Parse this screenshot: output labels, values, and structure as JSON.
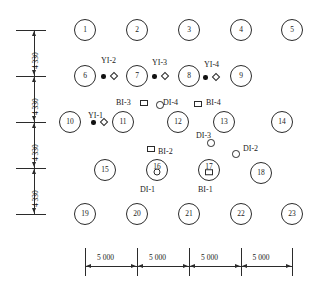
{
  "diagram": {
    "pile_diameter_px": 22,
    "piles": [
      {
        "id": "1",
        "label": "1",
        "x": 85,
        "y": 30,
        "glyph": "none"
      },
      {
        "id": "2",
        "label": "2",
        "x": 137,
        "y": 30,
        "glyph": "none"
      },
      {
        "id": "3",
        "label": "3",
        "x": 189,
        "y": 30,
        "glyph": "none"
      },
      {
        "id": "4",
        "label": "4",
        "x": 241,
        "y": 30,
        "glyph": "none"
      },
      {
        "id": "5",
        "label": "5",
        "x": 292,
        "y": 30,
        "glyph": "none"
      },
      {
        "id": "6",
        "label": "6",
        "x": 85,
        "y": 76,
        "glyph": "none"
      },
      {
        "id": "7",
        "label": "7",
        "x": 137,
        "y": 76,
        "glyph": "none"
      },
      {
        "id": "8",
        "label": "8",
        "x": 189,
        "y": 76,
        "glyph": "none"
      },
      {
        "id": "9",
        "label": "9",
        "x": 241,
        "y": 76,
        "glyph": "none"
      },
      {
        "id": "10",
        "label": "10",
        "x": 70,
        "y": 122,
        "glyph": "none"
      },
      {
        "id": "11",
        "label": "11",
        "x": 123,
        "y": 122,
        "glyph": "none"
      },
      {
        "id": "12",
        "label": "12",
        "x": 178,
        "y": 122,
        "glyph": "none"
      },
      {
        "id": "13",
        "label": "13",
        "x": 224,
        "y": 122,
        "glyph": "none"
      },
      {
        "id": "14",
        "label": "14",
        "x": 282,
        "y": 122,
        "glyph": "none"
      },
      {
        "id": "15",
        "label": "15",
        "x": 105,
        "y": 170,
        "glyph": "none"
      },
      {
        "id": "16",
        "label": "16",
        "x": 157,
        "y": 170,
        "glyph": "circle"
      },
      {
        "id": "17",
        "label": "17",
        "x": 209,
        "y": 170,
        "glyph": "square"
      },
      {
        "id": "18",
        "label": "18",
        "x": 261,
        "y": 173,
        "glyph": "none"
      },
      {
        "id": "19",
        "label": "19",
        "x": 85,
        "y": 214,
        "glyph": "none"
      },
      {
        "id": "20",
        "label": "20",
        "x": 137,
        "y": 214,
        "glyph": "none"
      },
      {
        "id": "21",
        "label": "21",
        "x": 189,
        "y": 214,
        "glyph": "none"
      },
      {
        "id": "22",
        "label": "22",
        "x": 241,
        "y": 214,
        "glyph": "none"
      },
      {
        "id": "23",
        "label": "23",
        "x": 292,
        "y": 214,
        "glyph": "none"
      }
    ],
    "instruments": [
      {
        "id": "YI-1",
        "label": "YI-1",
        "type": "strain-gauge",
        "label_x": 88,
        "label_y": 112,
        "dot_x": 91,
        "dot_y": 120,
        "diamond_x": 101,
        "diamond_y": 119
      },
      {
        "id": "YI-2",
        "label": "YI-2",
        "type": "strain-gauge",
        "label_x": 101,
        "label_y": 57,
        "dot_x": 101,
        "dot_y": 74,
        "diamond_x": 111,
        "diamond_y": 73
      },
      {
        "id": "YI-3",
        "label": "YI-3",
        "type": "strain-gauge",
        "label_x": 152,
        "label_y": 59,
        "dot_x": 152,
        "dot_y": 74,
        "diamond_x": 162,
        "diamond_y": 73
      },
      {
        "id": "YI-4",
        "label": "YI-4",
        "type": "strain-gauge",
        "label_x": 204,
        "label_y": 61,
        "dot_x": 203,
        "dot_y": 75,
        "diamond_x": 213,
        "diamond_y": 74
      },
      {
        "id": "BI-1",
        "label": "BI-1",
        "type": "inclinometer-square",
        "label_x": 198,
        "label_y": 186,
        "marker": "in-pile-17"
      },
      {
        "id": "BI-2",
        "label": "BI-2",
        "type": "inclinometer-square",
        "label_x": 158,
        "label_y": 148,
        "sq_x": 147,
        "sq_y": 146
      },
      {
        "id": "BI-3",
        "label": "BI-3",
        "type": "inclinometer-square",
        "label_x": 116,
        "label_y": 99,
        "sq_x": 140,
        "sq_y": 100
      },
      {
        "id": "BI-4",
        "label": "BI-4",
        "type": "inclinometer-square",
        "label_x": 206,
        "label_y": 99,
        "sq_x": 194,
        "sq_y": 101
      },
      {
        "id": "DI-1",
        "label": "DI-1",
        "type": "settlement-circle",
        "label_x": 140,
        "label_y": 186,
        "marker": "in-pile-16"
      },
      {
        "id": "DI-2",
        "label": "DI-2",
        "type": "settlement-circle",
        "label_x": 243,
        "label_y": 145,
        "circ_x": 232,
        "circ_y": 150
      },
      {
        "id": "DI-3",
        "label": "DI-3",
        "type": "settlement-circle",
        "label_x": 196,
        "label_y": 132,
        "circ_x": 207,
        "circ_y": 139
      },
      {
        "id": "DI-4",
        "label": "DI-4",
        "type": "settlement-circle",
        "label_x": 163,
        "label_y": 99,
        "circ_x": 156,
        "circ_y": 101
      }
    ],
    "vertical_dimensions": {
      "unit_hint": "mm",
      "values": [
        "4 330",
        "4 330",
        "4 330",
        "4 330"
      ],
      "tick_y": [
        30,
        76,
        122,
        168,
        214
      ],
      "line_x": 34,
      "tick_left": 16,
      "tick_right": 46
    },
    "horizontal_dimensions": {
      "unit_hint": "mm",
      "values": [
        "5 000",
        "5 000",
        "5 000",
        "5 000"
      ],
      "tick_x": [
        85,
        137,
        189,
        241,
        292
      ],
      "line_y": 266,
      "tick_top": 248,
      "tick_bottom": 276
    }
  }
}
